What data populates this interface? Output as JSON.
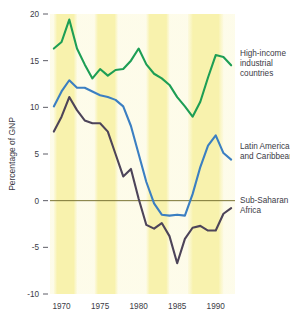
{
  "chart_data": {
    "type": "line",
    "title": "",
    "subtitle": "",
    "xlabel": "",
    "ylabel": "Percentage of GNP",
    "xlim": [
      1968.5,
      1992.5
    ],
    "ylim": [
      -10,
      20
    ],
    "grid": false,
    "legend_position": "inline-annotations",
    "y_ticks": [
      "20",
      "15",
      "10",
      "5",
      "0",
      "-5",
      "-10"
    ],
    "y_tick_values": [
      20,
      15,
      10,
      5,
      0,
      -5,
      -10
    ],
    "x_ticks": [
      "1970",
      "1975",
      "1980",
      "1985",
      "1990"
    ],
    "x_tick_values": [
      1970,
      1975,
      1980,
      1985,
      1990
    ],
    "zero_line": 0,
    "x": [
      1969,
      1970,
      1971,
      1972,
      1973,
      1974,
      1975,
      1976,
      1977,
      1978,
      1979,
      1980,
      1981,
      1982,
      1983,
      1984,
      1985,
      1986,
      1987,
      1988,
      1989,
      1990,
      1991,
      1992
    ],
    "series": [
      {
        "name": "High-income industrial countries",
        "color": "#1d9e55",
        "values": [
          16.3,
          17.0,
          19.4,
          16.3,
          14.6,
          13.1,
          14.1,
          13.4,
          14.0,
          14.1,
          15.0,
          16.3,
          14.6,
          13.6,
          13.1,
          12.4,
          11.1,
          10.1,
          9.0,
          10.6,
          13.2,
          15.6,
          15.4,
          14.5
        ],
        "annotation": "High-income\nindustrial\ncountries"
      },
      {
        "name": "Latin America and Caribbean",
        "color": "#3b7fc2",
        "values": [
          10.1,
          11.7,
          12.9,
          12.1,
          12.1,
          11.7,
          11.3,
          11.1,
          10.8,
          10.1,
          8.0,
          5.0,
          2.0,
          -0.3,
          -1.5,
          -1.6,
          -1.5,
          -1.6,
          0.7,
          3.6,
          5.9,
          7.0,
          5.1,
          4.4
        ],
        "annotation": "Latin America\nand Caribbean"
      },
      {
        "name": "Sub-Saharan Africa",
        "color": "#4d4459",
        "values": [
          7.4,
          9.0,
          11.1,
          9.7,
          8.6,
          8.3,
          8.3,
          7.4,
          5.0,
          2.6,
          3.4,
          0.2,
          -2.6,
          -3.0,
          -2.4,
          -3.8,
          -6.7,
          -4.1,
          -2.9,
          -2.7,
          -3.2,
          -3.2,
          -1.4,
          -0.8
        ],
        "annotation": "Sub-Saharan\nAfrica"
      }
    ],
    "shaded_bands": [
      {
        "start": 1969.0,
        "end": 1972.0
      },
      {
        "start": 1974.3,
        "end": 1977.3
      },
      {
        "start": 1981.0,
        "end": 1984.0
      },
      {
        "start": 1986.4,
        "end": 1991.0
      }
    ],
    "band_color": "#f7f0a8"
  },
  "annotations": {
    "high_income": {
      "line1": "High-income",
      "line2": "industrial",
      "line3": "countries"
    },
    "latin_america": {
      "line1": "Latin America",
      "line2": "and Caribbean"
    },
    "sub_saharan": {
      "line1": "Sub-Saharan",
      "line2": "Africa"
    }
  },
  "axis": {
    "y_title": "Percentage of GNP"
  }
}
